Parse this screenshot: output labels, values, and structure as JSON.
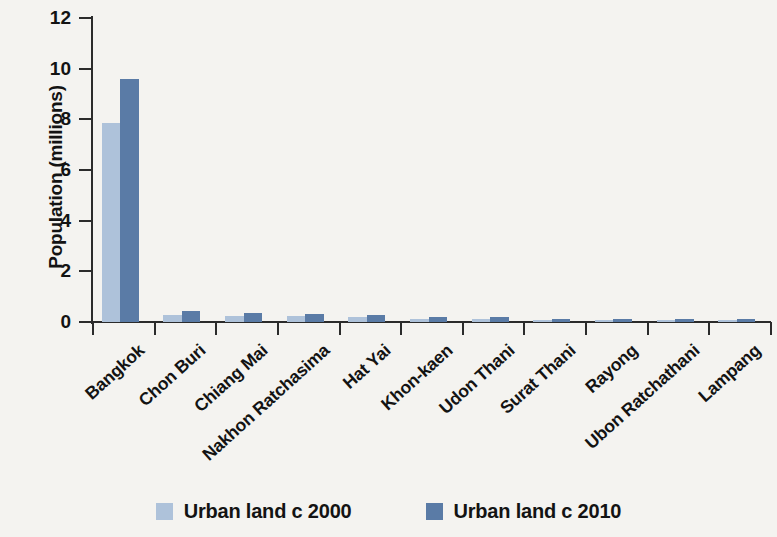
{
  "chart_data": {
    "type": "bar",
    "title": "",
    "xlabel": "",
    "ylabel": "Population (millions)",
    "ylim": [
      0,
      12
    ],
    "yticks": [
      0,
      2,
      4,
      6,
      8,
      10,
      12
    ],
    "ytick_labels": [
      "0",
      "2",
      "4",
      "6",
      "8",
      "10",
      "12"
    ],
    "grid": false,
    "legend_position": "bottom",
    "categories": [
      "Bangkok",
      "Chon Buri",
      "Chiang Mai",
      "Nakhon Ratchasima",
      "Hat Yai",
      "Khon-kaen",
      "Udon Thani",
      "Surat Thani",
      "Rayong",
      "Ubon Ratchathani",
      "Lampang"
    ],
    "series": [
      {
        "name": "Urban land c 2000",
        "color": "#aec2da",
        "values": [
          7.85,
          0.27,
          0.24,
          0.22,
          0.19,
          0.12,
          0.1,
          0.07,
          0.07,
          0.07,
          0.06
        ]
      },
      {
        "name": "Urban land c 2010",
        "color": "#5a7ba6",
        "values": [
          9.6,
          0.45,
          0.36,
          0.33,
          0.29,
          0.21,
          0.19,
          0.13,
          0.13,
          0.13,
          0.11
        ]
      }
    ]
  },
  "legend": {
    "items": [
      {
        "label": "Urban land c 2000",
        "color": "#aec2da"
      },
      {
        "label": "Urban land c 2010",
        "color": "#5a7ba6"
      }
    ]
  },
  "colors": {
    "background": "#f4f3f0",
    "axis": "#2b2b2b",
    "text": "#131313",
    "series_2000": "#aec2da",
    "series_2010": "#5a7ba6"
  }
}
